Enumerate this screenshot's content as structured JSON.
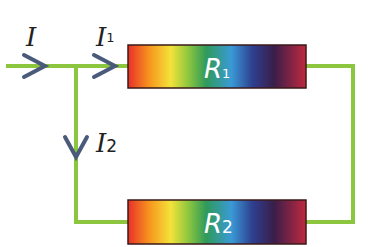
{
  "diagram": {
    "colors": {
      "wire": "#8cc63f",
      "arrow": "#4a5a7a",
      "resistor_border": "#3a1a1a",
      "label": "#222222",
      "resistor_text": "#ffffff"
    },
    "currents": [
      {
        "id": "I",
        "symbol": "I",
        "subscript": ""
      },
      {
        "id": "I1",
        "symbol": "I",
        "subscript": "1"
      },
      {
        "id": "I2",
        "symbol": "I",
        "subscript": "2"
      }
    ],
    "resistors": [
      {
        "id": "R1",
        "symbol": "R",
        "subscript": "1"
      },
      {
        "id": "R2",
        "symbol": "R",
        "subscript": "2"
      }
    ],
    "gradient_stops": [
      "#e8302a",
      "#f7951e",
      "#f4e23a",
      "#8cc63f",
      "#2f9a5a",
      "#3a9ad6",
      "#2e3f8f",
      "#3a1e4a",
      "#c0283e"
    ]
  }
}
